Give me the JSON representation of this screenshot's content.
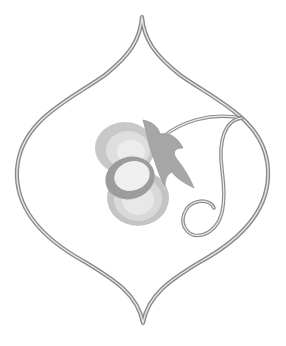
{
  "illustration": {
    "title": "Ornamental ogee frame with stylized flower and tendril",
    "background": "#ffffff",
    "colors": {
      "frame_stroke_outer": "#8a8a8a",
      "frame_stroke_inner": "#e6e6e6",
      "petal_light": "#e2e2e2",
      "petal_mid": "#c8c8c8",
      "petal_dark": "#b0b0b0",
      "ring": "#9c9c9c",
      "ring_center": "#efefef",
      "leaf": "#a6a6a6",
      "vine_outer": "#8e8e8e",
      "vine_inner": "#ececec"
    },
    "elements": [
      "ogee-frame",
      "flower",
      "leaf",
      "vine-tendril"
    ]
  }
}
